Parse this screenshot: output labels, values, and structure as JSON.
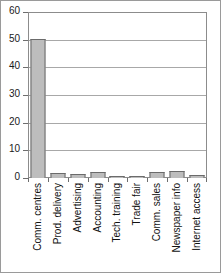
{
  "chart_data": {
    "type": "bar",
    "title": "",
    "xlabel": "",
    "ylabel": "",
    "categories": [
      "Comm. centres",
      "Prod. delivery",
      "Advertising",
      "Accounting",
      "Tech. training",
      "Trade fair",
      "Comm. sales",
      "Newspaper info",
      "Internet access"
    ],
    "values": [
      50.3,
      1.9,
      1.3,
      2.2,
      0.6,
      0.3,
      2.3,
      2.7,
      1.2
    ],
    "ylim": [
      0,
      60
    ],
    "yticks": [
      0,
      10,
      20,
      30,
      40,
      50,
      60
    ],
    "ytick_labels": [
      "0",
      "10",
      "20",
      "30",
      "40",
      "50",
      "60"
    ],
    "grid": true,
    "grid_axis": "y",
    "legend": false,
    "legend_position": "none",
    "bar_fill_color": "#bdbdbd",
    "bar_border_color": "#6b6b6b",
    "axis_color": "#8c8c8c",
    "gridline_color": "#a8a8a8",
    "label_rotation": 90
  }
}
